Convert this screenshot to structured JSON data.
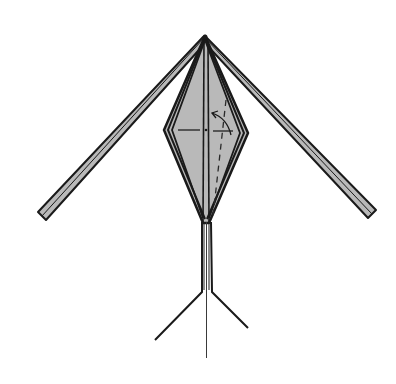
{
  "diagram": {
    "type": "origami-folding-step",
    "colors": {
      "background": "#ffffff",
      "paper_fill": "#b9b9b9",
      "outline": "#1a1a1a",
      "crease": "#2a2a2a"
    },
    "elements": {
      "left_wing": "long narrow flap extending to lower-left",
      "right_wing": "long narrow flap extending to lower-right",
      "body": "layered diamond shape",
      "center_crease": "vertical center line",
      "horizontal_crease": "short horizontal reference creases",
      "fold_line": "dashed valley fold line",
      "fold_arrow": "curved arrow indicating fold to the left",
      "legs": "two vertical strips splaying outward at the bottom",
      "tail": "thin center line extending below"
    }
  }
}
